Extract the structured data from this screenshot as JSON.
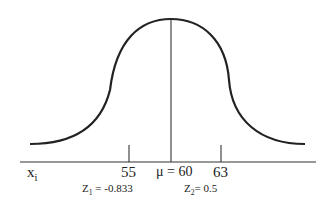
{
  "diagram": {
    "type": "normal-distribution-curve",
    "axis": {
      "variable_label": "x",
      "variable_subscript": "i",
      "ticks": [
        {
          "label": "55",
          "x": 129
        },
        {
          "label": "63",
          "x": 221
        }
      ],
      "mean": {
        "label": "μ = 60",
        "x": 171
      }
    },
    "z_scores": [
      {
        "prefix": "Z",
        "subscript": "1",
        "text": " =  -0.833"
      },
      {
        "prefix": "Z",
        "subscript": "2",
        "text": "= 0.5"
      }
    ],
    "colors": {
      "curve": "#222222",
      "axis": "#333333",
      "text": "#222222"
    }
  }
}
